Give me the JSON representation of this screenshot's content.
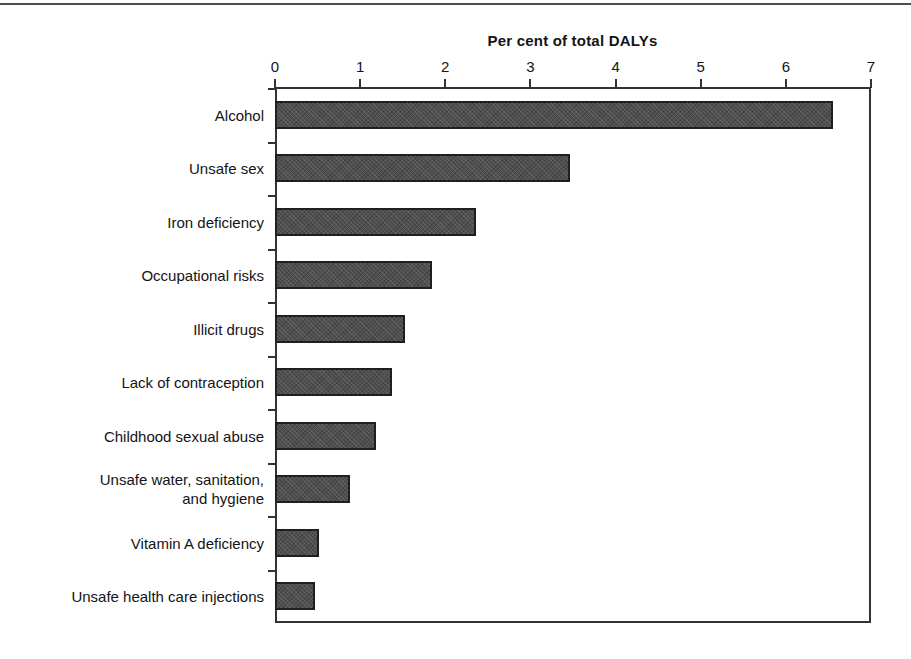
{
  "page": {
    "top_rule": "horizontal-rule"
  },
  "chart_data": {
    "type": "bar",
    "orientation": "horizontal",
    "title": "Per cent of total DALYs",
    "xlabel": "",
    "ylabel": "",
    "xlim": [
      0,
      7
    ],
    "xticks": [
      "0",
      "1",
      "2",
      "3",
      "4",
      "5",
      "6",
      "7"
    ],
    "grid": false,
    "legend": null,
    "bar_color": "#4f4f4f",
    "bar_edge_color": "#1f1f1f",
    "categories": [
      "Alcohol",
      "Unsafe sex",
      "Iron deficiency",
      "Occupational risks",
      "Illicit drugs",
      "Lack of contraception",
      "Childhood sexual abuse",
      "Unsafe water, sanitation,\nand hygiene",
      "Vitamin A deficiency",
      "Unsafe health care injections"
    ],
    "values": [
      6.55,
      3.47,
      2.36,
      1.84,
      1.53,
      1.38,
      1.19,
      0.88,
      0.52,
      0.47
    ]
  }
}
